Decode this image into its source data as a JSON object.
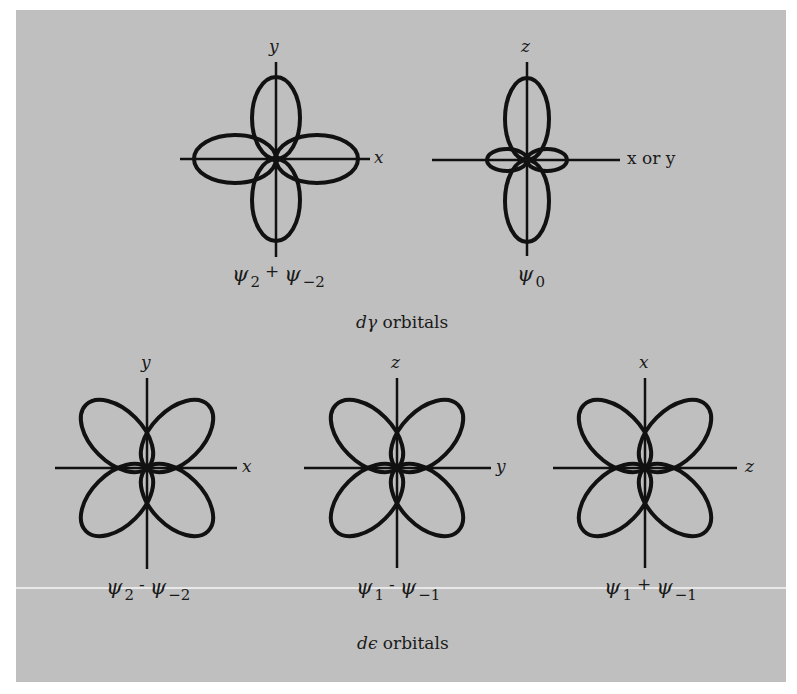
{
  "figure": {
    "background_color": "#bfbfbf",
    "stroke_color": "#111111"
  },
  "groups": {
    "d_gamma": {
      "caption_symbol": "dγ",
      "caption_text": "orbitals",
      "orbitals": [
        {
          "name": "psi2-plus-psi-minus2",
          "axis_vertical": "y",
          "axis_horizontal": "x",
          "formula": {
            "a_sym": "ψ",
            "a_sub": "2",
            "op": "+",
            "b_sym": "ψ",
            "b_sub": "−2"
          },
          "shape": "four lobes along axes"
        },
        {
          "name": "psi0",
          "axis_vertical": "z",
          "axis_horizontal": "x or y",
          "formula": {
            "a_sym": "ψ",
            "a_sub": "0"
          },
          "shape": "two large lobes along z, small torus-like lobes along x/y"
        }
      ]
    },
    "d_epsilon": {
      "caption_symbol": "dϵ",
      "caption_text": "orbitals",
      "orbitals": [
        {
          "name": "psi2-minus-psi-minus2",
          "axis_vertical": "y",
          "axis_horizontal": "x",
          "formula": {
            "a_sym": "ψ",
            "a_sub": "2",
            "op": "-",
            "b_sym": "ψ",
            "b_sub": "−2"
          },
          "shape": "four lobes between axes"
        },
        {
          "name": "psi1-minus-psi-minus1",
          "axis_vertical": "z",
          "axis_horizontal": "y",
          "formula": {
            "a_sym": "ψ",
            "a_sub": "1",
            "op": "-",
            "b_sym": "ψ",
            "b_sub": "−1"
          },
          "shape": "four lobes between axes"
        },
        {
          "name": "psi1-plus-psi-minus1",
          "axis_vertical": "x",
          "axis_horizontal": "z",
          "formula": {
            "a_sym": "ψ",
            "a_sub": "1",
            "op": "+",
            "b_sym": "ψ",
            "b_sub": "−1"
          },
          "shape": "four lobes between axes"
        }
      ]
    }
  }
}
